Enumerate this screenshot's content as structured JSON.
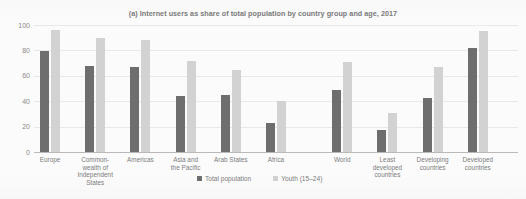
{
  "chart_data": {
    "type": "bar",
    "title": "(a) Internet users as share of total population by country group and age, 2017",
    "xlabel": "",
    "ylabel": "",
    "ylim": [
      0,
      100
    ],
    "yticks": [
      0,
      20,
      40,
      60,
      80,
      100
    ],
    "grid": true,
    "legend_position": "bottom-center",
    "categories": [
      "Europe",
      "Common-\nwealth of\nIndependent\nStates",
      "Americas",
      "Asia and\nthe Pacific",
      "Arab States",
      "Africa",
      "World",
      "Least\ndeveloped\ncountries",
      "Developing\ncountries",
      "Developed\ncountries"
    ],
    "series": [
      {
        "name": "Total population",
        "color": "#6e6e6e",
        "values": [
          79.6,
          67.7,
          66.7,
          44.3,
          44.9,
          22.9,
          48.6,
          17.5,
          42.7,
          82.2
        ]
      },
      {
        "name": "Youth (15–24)",
        "color": "#d2d2d2",
        "values": [
          96.0,
          89.7,
          88.0,
          72.0,
          64.6,
          40.2,
          71.0,
          30.4,
          67.2,
          95.3
        ]
      }
    ],
    "group_break_after_index": 5
  },
  "legend": {
    "items": [
      {
        "label": "Total population",
        "swatch": "total"
      },
      {
        "label": "Youth (15–24)",
        "swatch": "youth"
      }
    ]
  },
  "colors": {
    "total_population": "#6e6e6e",
    "youth": "#d2d2d2",
    "gridline": "#e9e9e9",
    "axis": "#b9b9b9",
    "text": "#7c7c7c",
    "background": "#fbfbfb"
  }
}
